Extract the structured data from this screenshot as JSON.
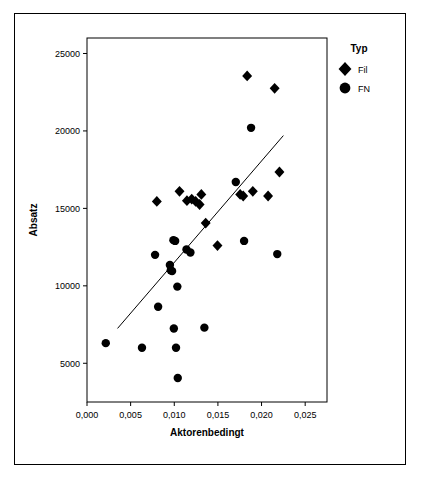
{
  "chart_data": {
    "type": "scatter",
    "title": "",
    "xlabel": "Aktorenbedingt",
    "ylabel": "Absatz",
    "xlim": [
      0.0,
      0.0275
    ],
    "ylim": [
      2500,
      26000
    ],
    "xticks": [
      "0,000",
      "0,005",
      "0,010",
      "0,015",
      "0,020",
      "0,025"
    ],
    "xtick_values": [
      0.0,
      0.005,
      0.01,
      0.015,
      0.02,
      0.025
    ],
    "yticks": [
      "5000",
      "10000",
      "15000",
      "20000",
      "25000"
    ],
    "ytick_values": [
      5000,
      10000,
      15000,
      20000,
      25000
    ],
    "grid": false,
    "legend": {
      "title": "Typ",
      "position": "top-right",
      "entries": [
        {
          "label": "Fil",
          "marker": "diamond"
        },
        {
          "label": "FN",
          "marker": "circle"
        }
      ]
    },
    "fit_line": {
      "x": [
        0.0035,
        0.0225
      ],
      "y": [
        7250,
        19700
      ]
    },
    "series": [
      {
        "name": "Fil",
        "marker": "diamond",
        "color": "#000000",
        "points": [
          {
            "x": 0.008,
            "y": 15450
          },
          {
            "x": 0.0106,
            "y": 16100
          },
          {
            "x": 0.01145,
            "y": 15500
          },
          {
            "x": 0.012,
            "y": 15600
          },
          {
            "x": 0.01245,
            "y": 15450
          },
          {
            "x": 0.0129,
            "y": 15250
          },
          {
            "x": 0.0131,
            "y": 15900
          },
          {
            "x": 0.0136,
            "y": 14050
          },
          {
            "x": 0.01495,
            "y": 12600
          },
          {
            "x": 0.01755,
            "y": 15900
          },
          {
            "x": 0.0179,
            "y": 15800
          },
          {
            "x": 0.01835,
            "y": 23550
          },
          {
            "x": 0.019,
            "y": 16100
          },
          {
            "x": 0.02075,
            "y": 15800
          },
          {
            "x": 0.0215,
            "y": 22750
          },
          {
            "x": 0.02205,
            "y": 17350
          }
        ]
      },
      {
        "name": "FN",
        "marker": "circle",
        "color": "#000000",
        "points": [
          {
            "x": 0.00215,
            "y": 6300
          },
          {
            "x": 0.0063,
            "y": 6000
          },
          {
            "x": 0.0078,
            "y": 12000
          },
          {
            "x": 0.00815,
            "y": 8650
          },
          {
            "x": 0.0095,
            "y": 11350
          },
          {
            "x": 0.0096,
            "y": 11000
          },
          {
            "x": 0.00975,
            "y": 10950
          },
          {
            "x": 0.0099,
            "y": 12950
          },
          {
            "x": 0.00995,
            "y": 7250
          },
          {
            "x": 0.0101,
            "y": 12900
          },
          {
            "x": 0.0102,
            "y": 6000
          },
          {
            "x": 0.01035,
            "y": 9950
          },
          {
            "x": 0.0104,
            "y": 4050
          },
          {
            "x": 0.0114,
            "y": 12350
          },
          {
            "x": 0.01185,
            "y": 12150
          },
          {
            "x": 0.01345,
            "y": 7300
          },
          {
            "x": 0.01705,
            "y": 16700
          },
          {
            "x": 0.018,
            "y": 12900
          },
          {
            "x": 0.0188,
            "y": 20200
          },
          {
            "x": 0.0218,
            "y": 12050
          }
        ]
      }
    ]
  }
}
